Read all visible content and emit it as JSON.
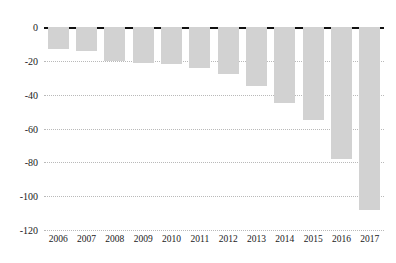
{
  "chart_data": {
    "type": "bar",
    "title": "",
    "subtitle": "",
    "xlabel": "",
    "ylabel": "",
    "categories": [
      "2006",
      "2007",
      "2008",
      "2009",
      "2010",
      "2011",
      "2012",
      "2013",
      "2014",
      "2015",
      "2016",
      "2017"
    ],
    "values": [
      -13,
      -14,
      -20,
      -21,
      -22,
      -24,
      -28,
      -35,
      -45,
      -55,
      -78,
      -108
    ],
    "ylim": [
      -120,
      0
    ],
    "xlim_note": "categorical, 12 evenly spaced bars",
    "yticks": [
      0,
      -20,
      -40,
      -60,
      -80,
      -100,
      -120
    ],
    "ytick_labels": [
      "0",
      "-20",
      "-40",
      "-60",
      "-80",
      "-100",
      "-120"
    ],
    "grid": "horizontal dotted gridlines at each y tick; solid black line at zero",
    "legend": "none",
    "legend_position": "none",
    "bar_color": "#d2d2d2",
    "zero_line_color": "#111111",
    "gridline_color": "#b9b9b9",
    "background_color": "#ffffff",
    "series": [
      {
        "name": "value",
        "values": [
          -13,
          -14,
          -20,
          -21,
          -22,
          -24,
          -28,
          -35,
          -45,
          -55,
          -78,
          -108
        ]
      }
    ],
    "annotations": []
  }
}
